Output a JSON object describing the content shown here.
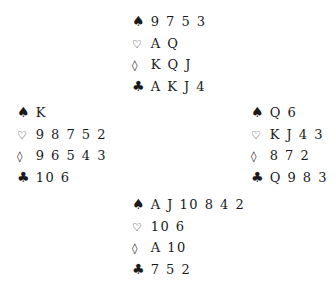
{
  "hands": {
    "north": {
      "spades": "9 7 5 3",
      "hearts": "A Q",
      "diamonds": "K Q J",
      "clubs": "A K J 4"
    },
    "west": {
      "spades": "K",
      "hearts": "9 8 7 5 2",
      "diamonds": "9 6 5 4 3",
      "clubs": "10 6"
    },
    "east": {
      "spades": "Q 6",
      "hearts": "K J 4 3",
      "diamonds": "8 7 2",
      "clubs": "Q 9 8 3"
    },
    "south": {
      "spades": "A J 10 8 4 2",
      "hearts": "10 6",
      "diamonds": "A 10",
      "clubs": "7 5 2"
    }
  },
  "suit_symbols": {
    "spades": "♠",
    "hearts": "♡",
    "diamonds": "◊",
    "clubs": "♣"
  }
}
